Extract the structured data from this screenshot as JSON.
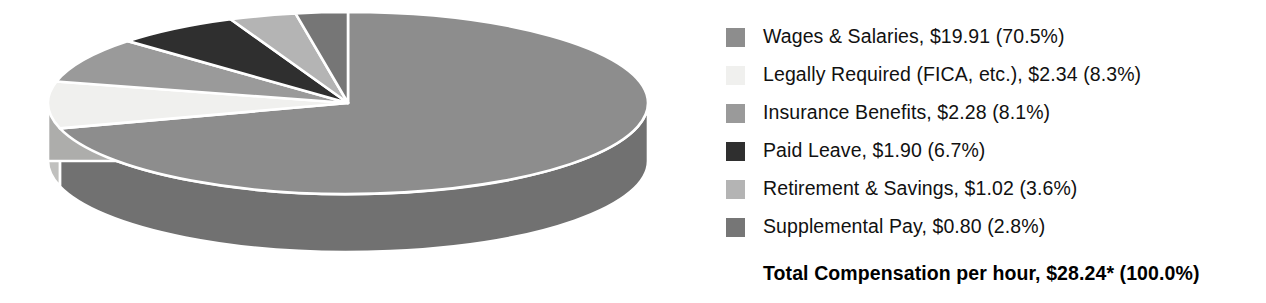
{
  "chart_data": {
    "type": "pie",
    "title": "",
    "subtitle": "",
    "xlabel": "",
    "ylabel": "",
    "legend_position": "right",
    "three_d": true,
    "categories": [
      "Wages & Salaries",
      "Legally Required (FICA, etc.)",
      "Insurance Benefits",
      "Paid Leave",
      "Retirement & Savings",
      "Supplemental Pay"
    ],
    "values": [
      19.91,
      2.34,
      2.28,
      1.9,
      1.02,
      0.8
    ],
    "percentages": [
      70.5,
      8.3,
      8.1,
      6.7,
      3.6,
      2.8
    ],
    "value_prefix": "$",
    "unit": "dollars per hour",
    "colors": [
      "#8d8d8d",
      "#f0f0ee",
      "#9a9a9a",
      "#2f2f2f",
      "#b4b4b4",
      "#767676"
    ],
    "slices": [
      {
        "label": "Wages & Salaries",
        "value": 19.91,
        "percent": 70.5,
        "color": "#8d8d8d"
      },
      {
        "label": "Legally Required (FICA, etc.)",
        "value": 2.34,
        "percent": 8.3,
        "color": "#f0f0ee"
      },
      {
        "label": "Insurance Benefits",
        "value": 2.28,
        "percent": 8.1,
        "color": "#9a9a9a"
      },
      {
        "label": "Paid Leave",
        "value": 1.9,
        "percent": 6.7,
        "color": "#2f2f2f"
      },
      {
        "label": "Retirement & Savings",
        "value": 1.02,
        "percent": 3.6,
        "color": "#b4b4b4"
      },
      {
        "label": "Supplemental Pay",
        "value": 0.8,
        "percent": 2.8,
        "color": "#767676"
      }
    ],
    "total": {
      "label": "Total Compensation per hour",
      "value": 28.24,
      "value_text": "$28.24*",
      "percent": 100.0
    }
  },
  "legend": {
    "entries": [
      {
        "text": "Wages & Salaries, $19.91 (70.5%)",
        "color": "#8d8d8d"
      },
      {
        "text": "Legally Required (FICA, etc.), $2.34 (8.3%)",
        "color": "#f0f0ee"
      },
      {
        "text": "Insurance Benefits, $2.28 (8.1%)",
        "color": "#9a9a9a"
      },
      {
        "text": "Paid Leave, $1.90 (6.7%)",
        "color": "#2f2f2f"
      },
      {
        "text": "Retirement & Savings, $1.02 (3.6%)",
        "color": "#b4b4b4"
      },
      {
        "text": "Supplemental Pay, $0.80 (2.8%)",
        "color": "#767676"
      }
    ],
    "total_text": "Total Compensation per hour, $28.24* (100.0%)"
  },
  "style": {
    "background": "#ffffff",
    "slice_border": "#ffffff",
    "text_color": "#111111",
    "total_text_color": "#000000"
  }
}
